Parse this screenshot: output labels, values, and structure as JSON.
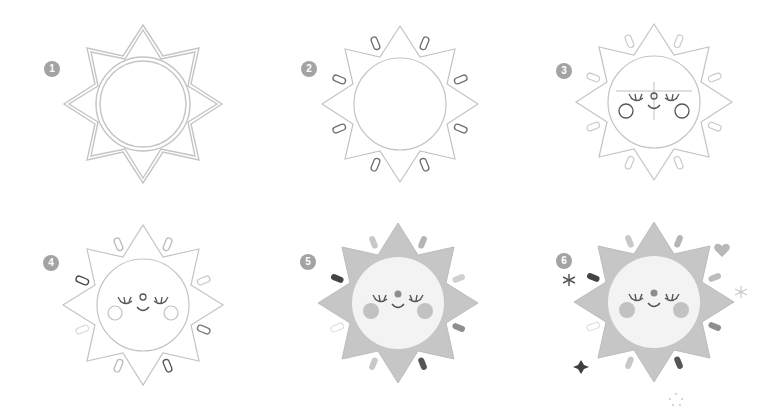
{
  "colors": {
    "outline": "#c8c8c8",
    "outline_dark": "#6e6e6e",
    "ray_fill": "#c6c6c6",
    "face_fill": "#f3f3f3",
    "cheek_fill": "#bdbdbd",
    "badge": "#a3a3a3"
  },
  "steps": [
    {
      "number": "1",
      "description": "Draw an eight-pointed star with a double outline and a circle in the middle"
    },
    {
      "number": "2",
      "description": "Add small rounded dashes between the points"
    },
    {
      "number": "3",
      "description": "Sketch guide lines and add closed eyes, nose and cheeks"
    },
    {
      "number": "4",
      "description": "Clean up the line art"
    },
    {
      "number": "5",
      "description": "Color the sun"
    },
    {
      "number": "6",
      "description": "Add sparkles, a heart and stars around it"
    }
  ]
}
